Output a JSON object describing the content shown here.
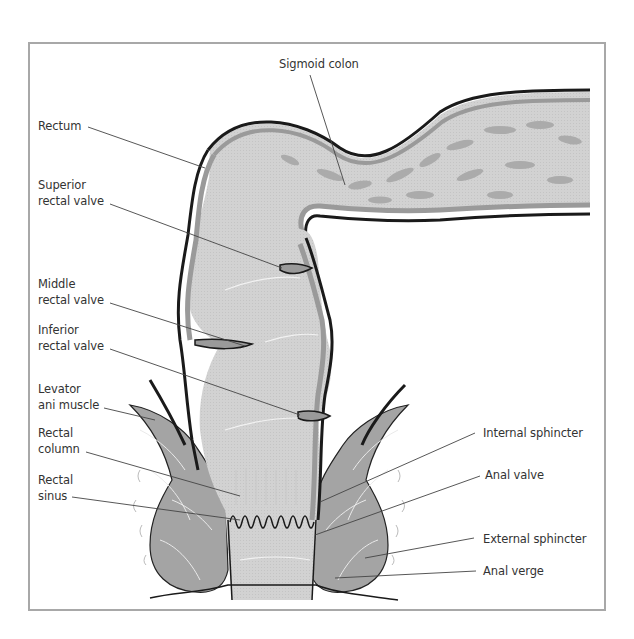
{
  "figure": {
    "labels": {
      "sigmoid_colon": "Sigmoid colon",
      "rectum": "Rectum",
      "superior_rectal_valve": [
        "Superior",
        "rectal valve"
      ],
      "middle_rectal_valve": [
        "Middle",
        "rectal valve"
      ],
      "inferior_rectal_valve": [
        "Inferior",
        "rectal valve"
      ],
      "levator_ani_muscle": [
        "Levator",
        "ani muscle"
      ],
      "rectal_column": [
        "Rectal",
        "column"
      ],
      "rectal_sinus": [
        "Rectal",
        "sinus"
      ],
      "internal_sphincter": "Internal sphincter",
      "anal_valve": "Anal valve",
      "external_sphincter": "External sphincter",
      "anal_verge": "Anal verge"
    },
    "colors": {
      "frame": "#a8a8a8",
      "outline": "#1a1a1a",
      "wall": "#9a9a9a",
      "lumen": "#d4d4d4",
      "mucosa_pattern": "#a9a9a9",
      "muscle": "#a2a2a2",
      "leader": "#444444"
    }
  }
}
